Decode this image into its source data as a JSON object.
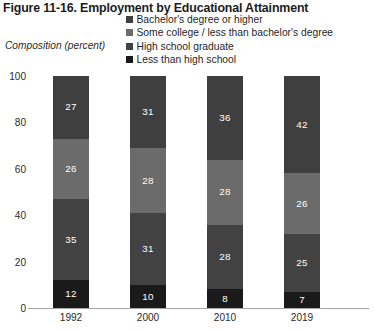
{
  "figure": {
    "title": "Figure 11-16. Employment by Educational Attainment",
    "axis_caption": "Composition (percent)"
  },
  "legend": {
    "items": [
      {
        "label": "Bachelor's degree or higher",
        "color": "#3f3f3f",
        "swatch_icon": "legend-square-icon"
      },
      {
        "label": "Some college / less than bachelor's degree",
        "color": "#6b6b6b",
        "swatch_icon": "legend-square-icon"
      },
      {
        "label": "High school graduate",
        "color": "#424242",
        "swatch_icon": "legend-square-icon"
      },
      {
        "label": "Less than high school",
        "color": "#1a1a1a",
        "swatch_icon": "legend-square-icon"
      }
    ]
  },
  "chart_data": {
    "type": "bar",
    "stacked": true,
    "title": "Figure 11-16. Employment by Educational Attainment",
    "xlabel": "",
    "ylabel": "Composition (percent)",
    "ylim": [
      0,
      100
    ],
    "yticks": [
      0,
      20,
      40,
      60,
      80,
      100
    ],
    "grid": false,
    "legend_position": "top-right",
    "categories": [
      "1992",
      "2000",
      "2010",
      "2019"
    ],
    "series": [
      {
        "name": "Less than high school",
        "color": "#1a1a1a",
        "values": [
          12,
          10,
          8,
          7
        ]
      },
      {
        "name": "High school graduate",
        "color": "#424242",
        "values": [
          35,
          31,
          28,
          25
        ]
      },
      {
        "name": "Some college / less than bachelor's degree",
        "color": "#6b6b6b",
        "values": [
          26,
          28,
          28,
          26
        ]
      },
      {
        "name": "Bachelor's degree or higher",
        "color": "#3f3f3f",
        "values": [
          27,
          31,
          36,
          42
        ]
      }
    ]
  }
}
